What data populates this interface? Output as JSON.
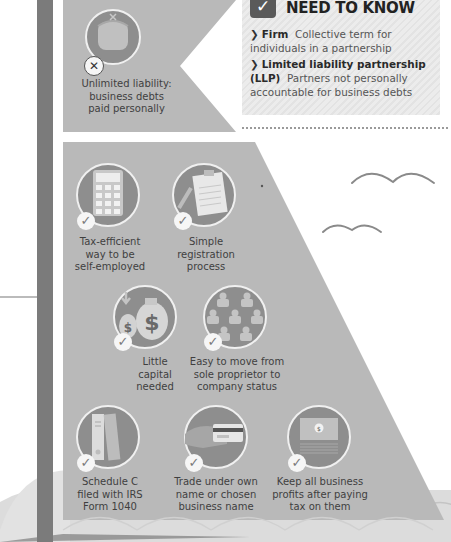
{
  "left_column": {
    "text_fragments": [
      "est",
      "r",
      "",
      "to",
      "o",
      "",
      "x",
      "n.",
      "ity,",
      "ust",
      "ave",
      "be"
    ]
  },
  "top_panel": {
    "icon": "purse-icon",
    "badge": "cross-icon",
    "label_lines": [
      "Unlimited liability:",
      "business debts",
      "paid personally"
    ]
  },
  "need_to_know": {
    "badge_icon": "check-icon",
    "badge_glyph": "✓",
    "title": "NEED TO KNOW",
    "items": [
      {
        "term": "Firm",
        "definition_line1": "Collective term for",
        "definition_line2": "individuals in a partnership"
      },
      {
        "term": "Limited liability partnership",
        "term2": "(LLP)",
        "definition_line1": "Partners not personally",
        "definition_line2": "accountable for business debts"
      }
    ],
    "arrow_glyph": "❯"
  },
  "benefits": [
    {
      "icon": "calculator-icon",
      "lines": [
        "Tax-efficient",
        "way to be",
        "self-employed"
      ]
    },
    {
      "icon": "clipboard-icon",
      "lines": [
        "Simple",
        "registration",
        "process"
      ]
    },
    {
      "icon": "money-bags-icon",
      "lines": [
        "Little",
        "capital",
        "needed"
      ]
    },
    {
      "icon": "people-group-icon",
      "lines": [
        "Easy to move from",
        "sole proprietor to",
        "company status"
      ]
    },
    {
      "icon": "binders-icon",
      "lines": [
        "Schedule C",
        "filed with IRS",
        "Form 1040"
      ]
    },
    {
      "icon": "hand-card-icon",
      "lines": [
        "Trade under own",
        "name or chosen",
        "business name"
      ]
    },
    {
      "icon": "banknotes-icon",
      "lines": [
        "Keep all business",
        "profits after paying",
        "tax on them"
      ]
    }
  ],
  "glyphs": {
    "check": "✓",
    "dollar": "$"
  },
  "colors": {
    "panel": "#b9b9b9",
    "circle": "#8e8e8e",
    "circle_ring": "#f2f2f2",
    "spine": "#7b7b7b",
    "text": "#3f3f3f"
  }
}
